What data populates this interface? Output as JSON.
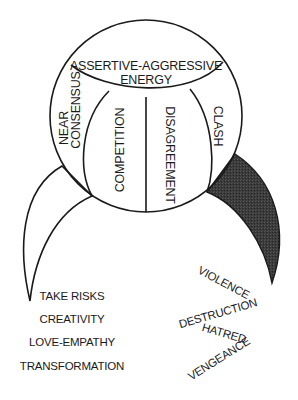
{
  "diagram": {
    "top_section": {
      "line1": "ASSERTIVE-AGGRESSIVE",
      "line2": "ENERGY"
    },
    "segments": {
      "near_consensus": {
        "line1": "NEAR",
        "line2": "CONSENSUS"
      },
      "competition": "COMPETITION",
      "disagreement": "DISAGREEMENT",
      "clash": "CLASH"
    },
    "positive_outcomes": [
      "TAKE RISKS",
      "CREATIVITY",
      "LOVE-EMPATHY",
      "TRANSFORMATION"
    ],
    "negative_outcomes": [
      "VIOLENCE",
      "DESTRUCTION",
      "HATRED",
      "VENGEANCE"
    ],
    "colors": {
      "line": "#1a1a1a",
      "dark_crescent": "#333333",
      "background": "#ffffff"
    }
  }
}
